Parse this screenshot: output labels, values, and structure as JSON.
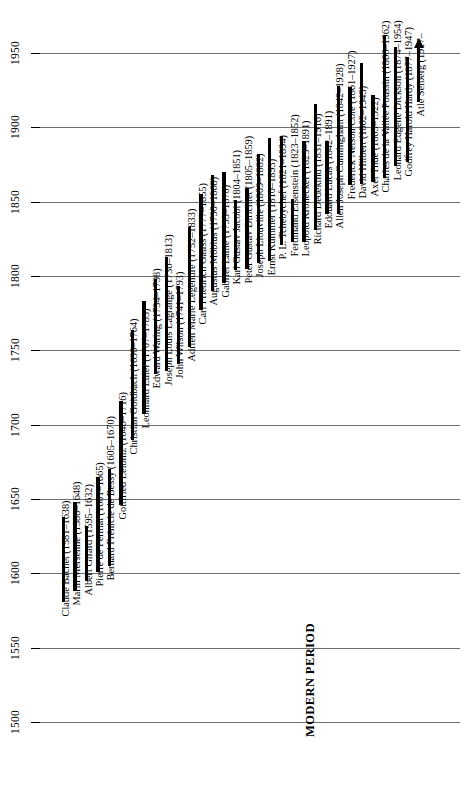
{
  "figure": {
    "type": "timeline",
    "orientation": "vertical-time-axis",
    "era_label": "MODERN PERIOD",
    "background": "#ffffff",
    "bar_color": "#000000",
    "gridline_color": "#6f6f6f"
  },
  "axis": {
    "label": "",
    "ticks": [
      1500,
      1550,
      1600,
      1650,
      1700,
      1750,
      1800,
      1850,
      1900,
      1950
    ],
    "min": 1500,
    "max": 1960,
    "grid": true
  },
  "chart_data": {
    "type": "bar",
    "title": "",
    "xlabel": "",
    "ylabel": "",
    "ylim": [
      1500,
      1960
    ],
    "categories": [
      "Claude Bachet",
      "Marin Mersenne",
      "Albert Girard",
      "Pierre de Fermat",
      "Bernard Frénicle de Bessy",
      "Gottfried Leibniz",
      "Christian Goldbach",
      "Leonhard Euler",
      "Edward Waring",
      "Joseph Louis Lagrange",
      "John Wilson",
      "Adrien Marie Legendre",
      "Carl Friedrich Gauss",
      "Augustus Möbius",
      "Gabriel Lamé",
      "Karl Gustav Jacobi",
      "Peter Gustav Dirichlet",
      "Joseph Liouville",
      "Ernst Kummer",
      "P. L. Tchebychef",
      "Ferdinand Eisenstein",
      "Leopold Kronecker",
      "Richard Dedekind",
      "Edouard Lucas",
      "Allen Joseph Cunningham",
      "Frederick Nelson Cole",
      "David Hilbert",
      "Axel Thue",
      "Charles de la Vallée Poussin",
      "Leonard Eugene Dickson",
      "Godfrey Harold Hardy",
      "Atle Selberg"
    ],
    "entries": [
      {
        "label": "Claude Bachet (1581–1638)",
        "name": "Claude Bachet",
        "birth": 1581,
        "death": 1638,
        "living": false
      },
      {
        "label": "Marin Mersenne (1588–1648)",
        "name": "Marin Mersenne",
        "birth": 1588,
        "death": 1648,
        "living": false
      },
      {
        "label": "Albert Girard (1595–1632)",
        "name": "Albert Girard",
        "birth": 1595,
        "death": 1632,
        "living": false
      },
      {
        "label": "Pierre de Fermat (1601–1665)",
        "name": "Pierre de Fermat",
        "birth": 1601,
        "death": 1665,
        "living": false
      },
      {
        "label": "Bernard Frénicle de Bessy (1605–1670)",
        "name": "Bernard Frénicle de Bessy",
        "birth": 1605,
        "death": 1670,
        "living": false
      },
      {
        "label": "Gottfried Leibniz (1646–1716)",
        "name": "Gottfried Leibniz",
        "birth": 1646,
        "death": 1716,
        "living": false
      },
      {
        "label": "Christian Goldbach (1690–1764)",
        "name": "Christian Goldbach",
        "birth": 1690,
        "death": 1764,
        "living": false
      },
      {
        "label": "Leonhard Euler (1707–1783)",
        "name": "Leonhard Euler",
        "birth": 1707,
        "death": 1783,
        "living": false
      },
      {
        "label": "Edward Waring (1734–1798)",
        "name": "Edward Waring",
        "birth": 1734,
        "death": 1798,
        "living": false
      },
      {
        "label": "Joseph Louis Lagrange (1736–1813)",
        "name": "Joseph Louis Lagrange",
        "birth": 1736,
        "death": 1813,
        "living": false
      },
      {
        "label": "John Wilson (1741–1793)",
        "name": "John Wilson",
        "birth": 1741,
        "death": 1793,
        "living": false
      },
      {
        "label": "Adrien Marie Legendre (1752–1833)",
        "name": "Adrien Marie Legendre",
        "birth": 1752,
        "death": 1833,
        "living": false
      },
      {
        "label": "Carl Friedrich Gauss (1777–1855)",
        "name": "Carl Friedrich Gauss",
        "birth": 1777,
        "death": 1855,
        "living": false
      },
      {
        "label": "Augustus Möbius (1790–1868)",
        "name": "Augustus Möbius",
        "birth": 1790,
        "death": 1868,
        "living": false
      },
      {
        "label": "Gabriel Lamé (1795–1870)",
        "name": "Gabriel Lamé",
        "birth": 1795,
        "death": 1870,
        "living": false
      },
      {
        "label": "Karl Gustav Jacobi (1804–1851)",
        "name": "Karl Gustav Jacobi",
        "birth": 1804,
        "death": 1851,
        "living": false
      },
      {
        "label": "Peter Gustav Dirichlet (1805–1859)",
        "name": "Peter Gustav Dirichlet",
        "birth": 1805,
        "death": 1859,
        "living": false
      },
      {
        "label": "Joseph Liouville (1809–1882)",
        "name": "Joseph Liouville",
        "birth": 1809,
        "death": 1882,
        "living": false
      },
      {
        "label": "Ernst Kummer (1810–1893)",
        "name": "Ernst Kummer",
        "birth": 1810,
        "death": 1893,
        "living": false
      },
      {
        "label": "P. L. Tchebychef (1821–1894)",
        "name": "P. L. Tchebychef",
        "birth": 1821,
        "death": 1894,
        "living": false
      },
      {
        "label": "Ferdinand Eisenstein (1823–1852)",
        "name": "Ferdinand Eisenstein",
        "birth": 1823,
        "death": 1852,
        "living": false
      },
      {
        "label": "Leopold Kronecker (1823–1891)",
        "name": "Leopold Kronecker",
        "birth": 1823,
        "death": 1891,
        "living": false
      },
      {
        "label": "Richard Dedekind (1831–1916)",
        "name": "Richard Dedekind",
        "birth": 1831,
        "death": 1916,
        "living": false
      },
      {
        "label": "Edouard Lucas (1842–1891)",
        "name": "Edouard Lucas",
        "birth": 1842,
        "death": 1891,
        "living": false
      },
      {
        "label": "Allen Joseph Cunningham (1842–1928)",
        "name": "Allen Joseph Cunningham",
        "birth": 1842,
        "death": 1928,
        "living": false
      },
      {
        "label": "Frederick Nelson Cole (1861–1927)",
        "name": "Frederick Nelson Cole",
        "birth": 1861,
        "death": 1927,
        "living": false
      },
      {
        "label": "David Hilbert (1862–1943)",
        "name": "David Hilbert",
        "birth": 1862,
        "death": 1943,
        "living": false
      },
      {
        "label": "Axel Thue (1863–1922)",
        "name": "Axel Thue",
        "birth": 1863,
        "death": 1922,
        "living": false
      },
      {
        "label": "Charles de la Vallée Poussin (1866–1962)",
        "name": "Charles de la Vallée Poussin",
        "birth": 1866,
        "death": 1962,
        "living": false
      },
      {
        "label": "Leonard Eugene Dickson (1874–1954)",
        "name": "Leonard Eugene Dickson",
        "birth": 1874,
        "death": 1954,
        "living": false
      },
      {
        "label": "Godfrey Harold Hardy (1877–1947)",
        "name": "Godfrey Harold Hardy",
        "birth": 1877,
        "death": 1947,
        "living": false
      },
      {
        "label": "Atle Selberg (1917–",
        "name": "Atle Selberg",
        "birth": 1917,
        "death": 1960,
        "living": true
      }
    ]
  }
}
